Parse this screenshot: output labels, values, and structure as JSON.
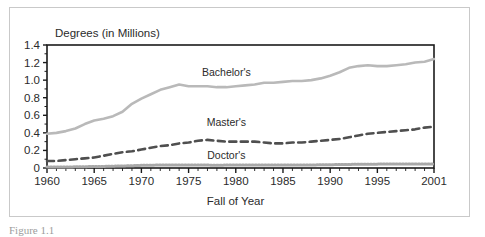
{
  "figure": {
    "caption_fragment": "Figure 1.1",
    "background_color": "#ffffff",
    "border_color": "#c9c9c9"
  },
  "chart_data": {
    "type": "line",
    "title": "",
    "ylabel": "Degrees (in Millions)",
    "xlabel": "Fall of Year",
    "xlim": [
      1960,
      2001
    ],
    "ylim": [
      0,
      1.4
    ],
    "grid": false,
    "legend_position": "inline-annotations",
    "ytick_labels": [
      "0",
      "0.2",
      "0.4",
      "0.6",
      "0.8",
      "1.0",
      "1.2",
      "1.4"
    ],
    "ytick_values": [
      0,
      0.2,
      0.4,
      0.6,
      0.8,
      1.0,
      1.2,
      1.4
    ],
    "xtick_labels": [
      "1960",
      "1965",
      "1970",
      "1975",
      "1980",
      "1985",
      "1990",
      "1995",
      "2001"
    ],
    "xtick_values": [
      1960,
      1965,
      1970,
      1975,
      1980,
      1985,
      1990,
      1995,
      2001
    ],
    "x": [
      1960,
      1961,
      1962,
      1963,
      1964,
      1965,
      1966,
      1967,
      1968,
      1969,
      1970,
      1971,
      1972,
      1973,
      1974,
      1975,
      1976,
      1977,
      1978,
      1979,
      1980,
      1981,
      1982,
      1983,
      1984,
      1985,
      1986,
      1987,
      1988,
      1989,
      1990,
      1991,
      1992,
      1993,
      1994,
      1995,
      1996,
      1997,
      1998,
      1999,
      2000,
      2001
    ],
    "series": [
      {
        "name": "Bachelor's",
        "color": "#b9b9b9",
        "style": "solid",
        "label_x": 1979,
        "label_y": 1.05,
        "values": [
          0.39,
          0.4,
          0.42,
          0.45,
          0.5,
          0.54,
          0.56,
          0.59,
          0.64,
          0.73,
          0.79,
          0.84,
          0.89,
          0.92,
          0.95,
          0.93,
          0.93,
          0.93,
          0.92,
          0.92,
          0.93,
          0.94,
          0.95,
          0.97,
          0.97,
          0.98,
          0.99,
          0.99,
          1.0,
          1.02,
          1.05,
          1.09,
          1.14,
          1.16,
          1.17,
          1.16,
          1.16,
          1.17,
          1.18,
          1.2,
          1.21,
          1.24
        ]
      },
      {
        "name": "Master's",
        "color": "#4f4f4f",
        "style": "dashed",
        "label_x": 1979,
        "label_y": 0.48,
        "values": [
          0.08,
          0.08,
          0.09,
          0.1,
          0.11,
          0.12,
          0.14,
          0.16,
          0.18,
          0.19,
          0.21,
          0.23,
          0.25,
          0.26,
          0.28,
          0.29,
          0.31,
          0.32,
          0.31,
          0.3,
          0.3,
          0.3,
          0.3,
          0.29,
          0.28,
          0.28,
          0.29,
          0.29,
          0.3,
          0.31,
          0.32,
          0.33,
          0.35,
          0.37,
          0.39,
          0.4,
          0.41,
          0.42,
          0.43,
          0.44,
          0.46,
          0.47
        ]
      },
      {
        "name": "Doctor's",
        "color": "#a8a8a8",
        "style": "dotted",
        "label_x": 1979,
        "label_y": 0.1,
        "values": [
          0.01,
          0.011,
          0.012,
          0.013,
          0.015,
          0.017,
          0.018,
          0.021,
          0.023,
          0.026,
          0.03,
          0.032,
          0.034,
          0.035,
          0.034,
          0.034,
          0.034,
          0.033,
          0.032,
          0.033,
          0.033,
          0.033,
          0.033,
          0.033,
          0.033,
          0.033,
          0.034,
          0.034,
          0.035,
          0.036,
          0.038,
          0.039,
          0.041,
          0.042,
          0.043,
          0.044,
          0.045,
          0.046,
          0.046,
          0.045,
          0.045,
          0.045
        ]
      }
    ]
  }
}
